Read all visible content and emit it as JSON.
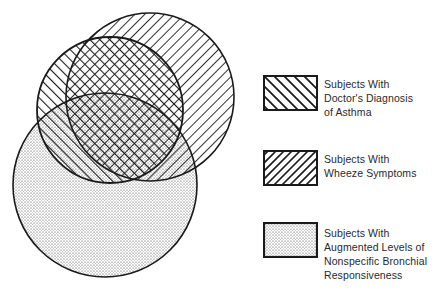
{
  "diagram": {
    "type": "venn",
    "sets": [
      {
        "id": "asthma",
        "pattern": "backslash-hatch",
        "label_lines": [
          "Subjects With",
          "Doctor's Diagnosis",
          "of Asthma"
        ],
        "circle": {
          "cx": 110,
          "cy": 110,
          "r": 73
        }
      },
      {
        "id": "wheeze",
        "pattern": "forward-slash-hatch",
        "label_lines": [
          "Subjects With",
          "Wheeze Symptoms"
        ],
        "circle": {
          "cx": 150,
          "cy": 97,
          "r": 84
        }
      },
      {
        "id": "bhr",
        "pattern": "stipple",
        "label_lines": [
          "Subjects With",
          "Augmented Levels of",
          "Nonspecific Bronchial",
          "Responsiveness"
        ],
        "circle": {
          "cx": 105,
          "cy": 185,
          "r": 92
        }
      }
    ],
    "colors": {
      "ink": "#1a1a1a",
      "background": "#ffffff",
      "text": "#2a2a2a"
    }
  },
  "legend": {
    "items": [
      {
        "lines": [
          "Subjects With",
          "Doctor's Diagnosis",
          "of Asthma"
        ]
      },
      {
        "lines": [
          "Subjects With",
          "Wheeze Symptoms"
        ]
      },
      {
        "lines": [
          "Subjects With",
          "Augmented Levels of",
          "Nonspecific Bronchial",
          "Responsiveness"
        ]
      }
    ]
  }
}
